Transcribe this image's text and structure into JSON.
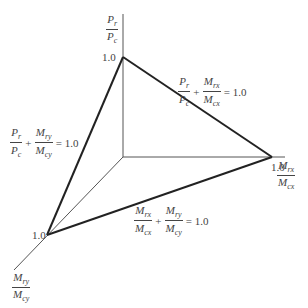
{
  "diagram": {
    "title": "",
    "axes": {
      "vertical": {
        "num": "Pr",
        "den": "Pc",
        "tick": "1.0"
      },
      "horizontal": {
        "num": "Mrx",
        "den": "Mcx",
        "tick": "1.0"
      },
      "diagonal": {
        "num": "Mry",
        "den": "Mcy",
        "tick": "1.0"
      }
    },
    "equations": [
      {
        "id": "p-mx",
        "a_num": "Pr",
        "a_den": "Pc",
        "op": "+",
        "b_num": "Mrx",
        "b_den": "Mcx",
        "rhs": "= 1.0"
      },
      {
        "id": "p-my",
        "a_num": "Pr",
        "a_den": "Pc",
        "op": "+",
        "b_num": "Mry",
        "b_den": "Mcy",
        "rhs": "= 1.0"
      },
      {
        "id": "mx-my",
        "a_num": "Mrx",
        "a_den": "Mcx",
        "op": "+",
        "b_num": "Mry",
        "b_den": "Mcy",
        "rhs": "= 1.0"
      }
    ],
    "colors": {
      "axis": "#555555",
      "envelope": "#222222"
    }
  }
}
